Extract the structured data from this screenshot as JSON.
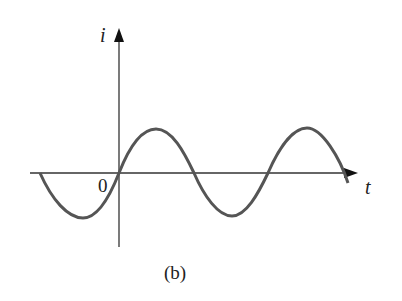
{
  "figure": {
    "caption": "(b)",
    "y_axis_label": "i",
    "x_axis_label": "t",
    "origin_label": "0",
    "curve": "sinusoid",
    "colors": {
      "axes": "#333333",
      "curve": "#555555",
      "text": "#222222"
    }
  }
}
